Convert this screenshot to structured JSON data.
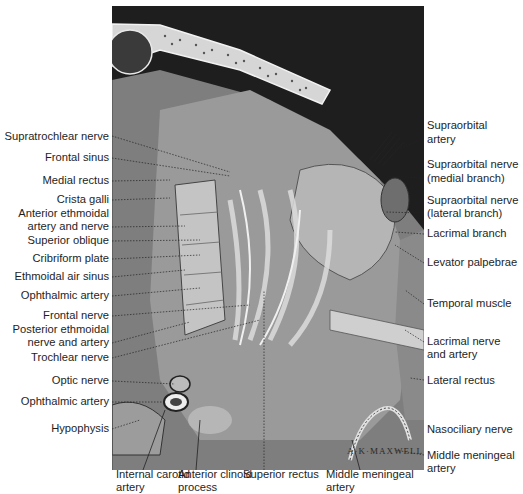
{
  "figure": {
    "signature": "A·K·MAXWELL"
  },
  "labels_left": [
    {
      "text": "Supratrochlear nerve",
      "y": 136
    },
    {
      "text": "Frontal sinus",
      "y": 157
    },
    {
      "text": "Medial rectus",
      "y": 180
    },
    {
      "text": "Crista galli",
      "y": 199
    },
    {
      "text": "Anterior ethmoidal",
      "y": 213
    },
    {
      "text": "artery and nerve",
      "y": 226
    },
    {
      "text": "Superior oblique",
      "y": 240
    },
    {
      "text": "Cribriform plate",
      "y": 258
    },
    {
      "text": "Ethmoidal air sinus",
      "y": 276
    },
    {
      "text": "Ophthalmic artery",
      "y": 295
    },
    {
      "text": "Frontal nerve",
      "y": 315
    },
    {
      "text": "Posterior ethmoidal",
      "y": 329
    },
    {
      "text": "nerve and artery",
      "y": 342
    },
    {
      "text": "Trochlear nerve",
      "y": 357
    },
    {
      "text": "Optic nerve",
      "y": 380
    },
    {
      "text": "Ophthalmic artery",
      "y": 401
    },
    {
      "text": "Hypophysis",
      "y": 428
    }
  ],
  "labels_right": [
    {
      "text": "Supraorbital",
      "y": 125
    },
    {
      "text": "artery",
      "y": 139
    },
    {
      "text": "Supraorbital nerve",
      "y": 164
    },
    {
      "text": "(medial branch)",
      "y": 178
    },
    {
      "text": "Supraorbital nerve",
      "y": 200
    },
    {
      "text": "(lateral branch)",
      "y": 213
    },
    {
      "text": "Lacrimal branch",
      "y": 233
    },
    {
      "text": "Levator palpebrae",
      "y": 262
    },
    {
      "text": "Temporal muscle",
      "y": 303
    },
    {
      "text": "Lacrimal nerve",
      "y": 341
    },
    {
      "text": "and artery",
      "y": 354
    },
    {
      "text": "Lateral rectus",
      "y": 380
    },
    {
      "text": "Nasociliary nerve",
      "y": 429
    },
    {
      "text": "Middle meningeal",
      "y": 455
    },
    {
      "text": "artery",
      "y": 468
    }
  ],
  "labels_bottom": [
    {
      "text": "Internal carotid",
      "x": 116,
      "y": 474
    },
    {
      "text": "artery",
      "x": 116,
      "y": 487
    },
    {
      "text": "Anterior clinoid",
      "x": 178,
      "y": 474
    },
    {
      "text": "process",
      "x": 178,
      "y": 487
    },
    {
      "text": "Superior rectus",
      "x": 243,
      "y": 474
    },
    {
      "text": "Middle meningeal",
      "x": 326,
      "y": 474
    },
    {
      "text": "artery",
      "x": 326,
      "y": 487
    }
  ],
  "colors": {
    "background": "#ffffff",
    "dark_field": "#1c1c1c",
    "bone": "#d8d8d8",
    "tissue": "#8a8a8a",
    "muscle": "#a9a9a9",
    "label_text": "#1e1e1e",
    "leader_line": "#333333"
  }
}
